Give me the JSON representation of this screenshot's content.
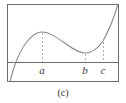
{
  "figure": {
    "caption": "(c)",
    "colors": {
      "frame": "#6b6b6b",
      "axis": "#6b6b6b",
      "curve": "#8a8a8a",
      "dashed": "#9a9a9a",
      "text": "#3a3a3a"
    },
    "frame": {
      "x": 7,
      "y": 4,
      "width": 112,
      "height": 78
    },
    "axis_y": 62,
    "points": [
      {
        "label": "a",
        "x": 42,
        "curve_y": 32,
        "label_y": 65,
        "kind": "local maximum"
      },
      {
        "label": "b",
        "x": 85,
        "curve_y": 53,
        "label_y": 65,
        "kind": "local minimum"
      },
      {
        "label": "c",
        "x": 103,
        "curve_y": 41,
        "label_y": 65,
        "kind": "point"
      }
    ],
    "curve_path": "M10,82 C12,74 14,67 16,62 C22,46 32,32 42,32 C56,32 72,53 85,53 C94,53 99,47 103,41 C108,32 114,18 118,4"
  }
}
